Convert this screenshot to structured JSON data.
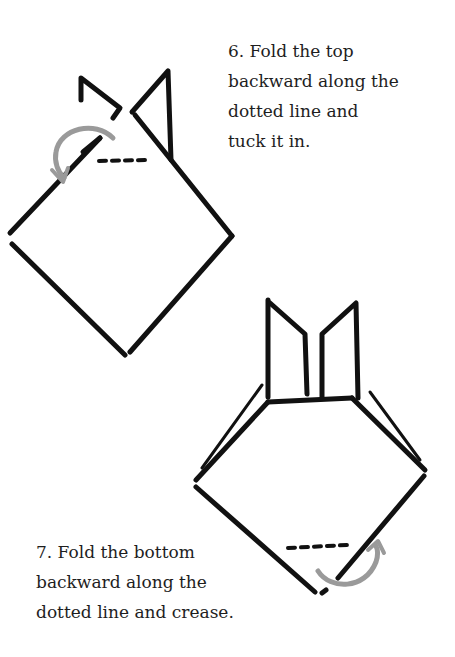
{
  "steps": [
    {
      "number": "6.",
      "lines": [
        "6. Fold the top",
        "backward along the",
        "dotted line and",
        "tuck it in."
      ]
    },
    {
      "number": "7.",
      "lines": [
        "7. Fold the bottom",
        "backward along the",
        "dotted line and crease."
      ]
    }
  ],
  "colors": {
    "ink": "#111111",
    "arrow": "#9a9a9a",
    "background": "#ffffff"
  }
}
